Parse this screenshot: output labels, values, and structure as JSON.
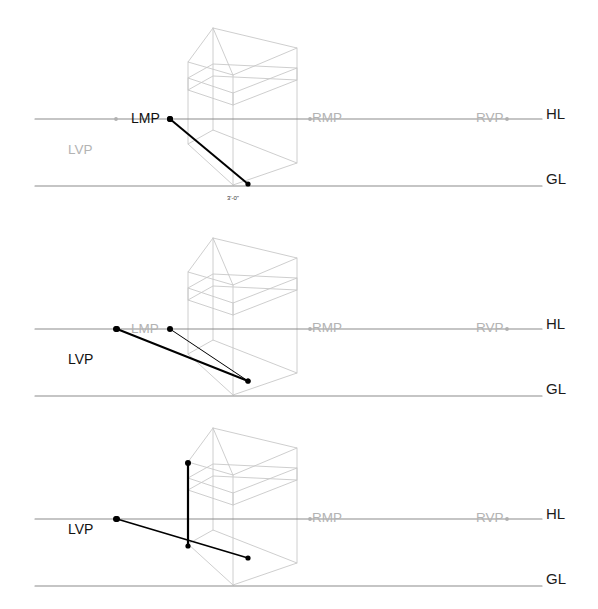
{
  "drawing": {
    "title": "Two-point perspective measuring-point construction",
    "background_color": "#ffffff",
    "width": 598,
    "height": 609,
    "colors": {
      "reference_line": "#8c8c8c",
      "box_wireframe": "#c8c8c8",
      "active_line": "#000000",
      "active_point": "#000000",
      "inactive_point": "#b0b0b0",
      "label_dark": "#111111",
      "label_gray": "#b3b3b3",
      "dimension_text": "#333333"
    },
    "common_labels": {
      "horizon_line": "HL",
      "ground_line": "GL",
      "left_vanishing_point": "LVP",
      "left_measuring_point": "LMP",
      "right_measuring_point": "RMP",
      "right_vanishing_point": "RVP"
    },
    "reference_geometry": {
      "line_start_x": 35,
      "line_end_x": 542,
      "label_x": 546,
      "lvp_x": 116,
      "lmp_x": 170,
      "rmp_x": 310,
      "rvp_x": 507,
      "horizon_y": 119,
      "ground_y": 186
    },
    "box_wireframe": {
      "description": "Transparent rectangular volume with upper roof plane",
      "front_vertical_x": 188,
      "center_vertical_x": 233,
      "right_vertical_x": 297,
      "apex_top": [
        213,
        28
      ]
    }
  },
  "panels": [
    {
      "id": "panel-1",
      "index": 1,
      "top": 0,
      "height": 210,
      "visible_labels": {
        "hl": "HL",
        "gl": "GL",
        "lvp": "LVP",
        "lmp": "LMP",
        "rmp": "RMP",
        "rvp": "RVP"
      },
      "active_points": [
        "LMP"
      ],
      "inactive_points": [
        "LVP",
        "RMP",
        "RVP"
      ],
      "dimension_label": "3'-0\"",
      "dimension_label_x": 233,
      "dimension_label_y": 200,
      "construction_lines": [
        {
          "name": "lmp-to-ground-measure",
          "from": [
            170,
            119
          ],
          "to": [
            248,
            184
          ],
          "weight": 2.0
        }
      ],
      "label_positions": {
        "lmp": [
          131,
          112
        ],
        "lvp": [
          68,
          143
        ],
        "rmp": [
          312,
          111
        ],
        "rvp": [
          476,
          111
        ],
        "hl": [
          546,
          113
        ],
        "gl": [
          546,
          178
        ]
      }
    },
    {
      "id": "panel-2",
      "index": 2,
      "top": 210,
      "height": 200,
      "visible_labels": {
        "hl": "HL",
        "gl": "GL",
        "lvp": "LVP",
        "lmp": "LMP",
        "rmp": "RMP",
        "rvp": "RVP"
      },
      "active_points": [
        "LVP"
      ],
      "inactive_points": [
        "LMP",
        "RMP",
        "RVP"
      ],
      "dimension_label": "",
      "construction_lines": [
        {
          "name": "lvp-to-ground-convergence",
          "from": [
            117,
            119
          ],
          "to": [
            248,
            171
          ],
          "weight": 2.0
        },
        {
          "name": "lmp-to-ground-convergence",
          "from": [
            170,
            119
          ],
          "to": [
            248,
            171
          ],
          "weight": 1.0
        }
      ],
      "label_positions": {
        "lmp": [
          131,
          112
        ],
        "lvp": [
          68,
          143
        ],
        "rmp": [
          312,
          111
        ],
        "rvp": [
          476,
          111
        ],
        "hl": [
          546,
          113
        ],
        "gl": [
          546,
          178
        ]
      }
    },
    {
      "id": "panel-3",
      "index": 3,
      "top": 400,
      "height": 209,
      "visible_labels": {
        "hl": "HL",
        "gl": "GL",
        "lvp": "LVP",
        "rmp": "RMP",
        "rvp": "RVP"
      },
      "active_points": [
        "LVP"
      ],
      "inactive_points": [
        "RMP",
        "RVP"
      ],
      "dimension_label": "",
      "construction_lines": [
        {
          "name": "lvp-to-base-corner",
          "from": [
            117,
            119
          ],
          "to": [
            248,
            158
          ],
          "weight": 1.6
        },
        {
          "name": "vertical-height-measure",
          "from": [
            188,
            63
          ],
          "to": [
            188,
            146
          ],
          "weight": 2.2
        }
      ],
      "label_positions": {
        "lvp": [
          68,
          123
        ],
        "rmp": [
          312,
          111
        ],
        "rvp": [
          476,
          111
        ],
        "hl": [
          546,
          113
        ],
        "gl": [
          546,
          178
        ]
      }
    }
  ]
}
